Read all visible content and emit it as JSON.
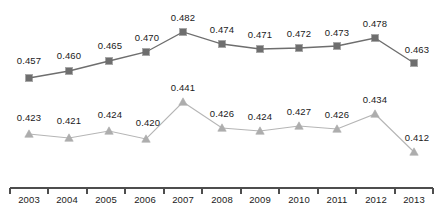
{
  "chart_data": {
    "type": "line",
    "title": "",
    "subtitle": "",
    "xlabel": "",
    "ylabel": "",
    "categories": [
      "2003",
      "2004",
      "2005",
      "2006",
      "2007",
      "2008",
      "2009",
      "2010",
      "2011",
      "2012",
      "2013"
    ],
    "ylim": [
      0.405,
      0.492
    ],
    "grid": false,
    "legend": "none",
    "axis": {
      "x_axis_visible": true,
      "y_axis_visible": false,
      "tick_marks": "between-categories"
    },
    "series": [
      {
        "name": "series-1",
        "marker": "square",
        "color": "#6e6e6e",
        "line_color": "#6e6e6e",
        "values": [
          0.457,
          0.46,
          0.465,
          0.47,
          0.482,
          0.474,
          0.471,
          0.472,
          0.473,
          0.478,
          0.463
        ],
        "labels": [
          "0.457",
          "0.460",
          "0.465",
          "0.470",
          "0.482",
          "0.474",
          "0.471",
          "0.472",
          "0.473",
          "0.478",
          "0.463"
        ]
      },
      {
        "name": "series-2",
        "marker": "triangle",
        "color": "#adadad",
        "line_color": "#b5b5b5",
        "values": [
          0.423,
          0.421,
          0.424,
          0.42,
          0.441,
          0.426,
          0.424,
          0.427,
          0.426,
          0.434,
          0.412
        ],
        "labels": [
          "0.423",
          "0.421",
          "0.424",
          "0.420",
          "0.441",
          "0.426",
          "0.424",
          "0.427",
          "0.426",
          "0.434",
          "0.412"
        ]
      }
    ]
  },
  "layout": {
    "series1_points": [
      {
        "x": 29,
        "y": 78
      },
      {
        "x": 69,
        "y": 71
      },
      {
        "x": 109,
        "y": 61
      },
      {
        "x": 146,
        "y": 52
      },
      {
        "x": 183,
        "y": 32
      },
      {
        "x": 222,
        "y": 44
      },
      {
        "x": 260,
        "y": 49
      },
      {
        "x": 299,
        "y": 48
      },
      {
        "x": 337,
        "y": 46
      },
      {
        "x": 375,
        "y": 38
      },
      {
        "x": 414,
        "y": 63
      }
    ],
    "series2_points": [
      {
        "x": 29,
        "y": 134
      },
      {
        "x": 69,
        "y": 138
      },
      {
        "x": 109,
        "y": 131
      },
      {
        "x": 146,
        "y": 139
      },
      {
        "x": 183,
        "y": 102
      },
      {
        "x": 222,
        "y": 128
      },
      {
        "x": 260,
        "y": 131
      },
      {
        "x": 299,
        "y": 126
      },
      {
        "x": 337,
        "y": 129
      },
      {
        "x": 375,
        "y": 114
      },
      {
        "x": 414,
        "y": 152
      }
    ],
    "series1_label_pos": [
      {
        "x": 29,
        "y": 61
      },
      {
        "x": 69,
        "y": 56
      },
      {
        "x": 110,
        "y": 46
      },
      {
        "x": 147,
        "y": 38
      },
      {
        "x": 183,
        "y": 18
      },
      {
        "x": 222,
        "y": 30
      },
      {
        "x": 260,
        "y": 35
      },
      {
        "x": 299,
        "y": 34
      },
      {
        "x": 337,
        "y": 33
      },
      {
        "x": 375,
        "y": 24
      },
      {
        "x": 417,
        "y": 50
      }
    ],
    "series2_label_pos": [
      {
        "x": 29,
        "y": 118
      },
      {
        "x": 69,
        "y": 121
      },
      {
        "x": 110,
        "y": 115
      },
      {
        "x": 148,
        "y": 123
      },
      {
        "x": 183,
        "y": 88
      },
      {
        "x": 222,
        "y": 114
      },
      {
        "x": 260,
        "y": 117
      },
      {
        "x": 299,
        "y": 112
      },
      {
        "x": 337,
        "y": 115
      },
      {
        "x": 375,
        "y": 100
      },
      {
        "x": 417,
        "y": 138
      }
    ],
    "tick_label_pos": [
      {
        "x": 29
      },
      {
        "x": 67
      },
      {
        "x": 106
      },
      {
        "x": 145
      },
      {
        "x": 183
      },
      {
        "x": 222
      },
      {
        "x": 260
      },
      {
        "x": 299
      },
      {
        "x": 337
      },
      {
        "x": 376
      },
      {
        "x": 414
      }
    ],
    "axis_y": 188,
    "axis_x_start": 10,
    "axis_x_end": 433,
    "tick_positions": [
      10,
      48,
      87,
      125,
      164,
      202,
      241,
      279,
      318,
      356,
      395,
      433
    ],
    "tick_length": 6,
    "tick_label_y": 195
  }
}
